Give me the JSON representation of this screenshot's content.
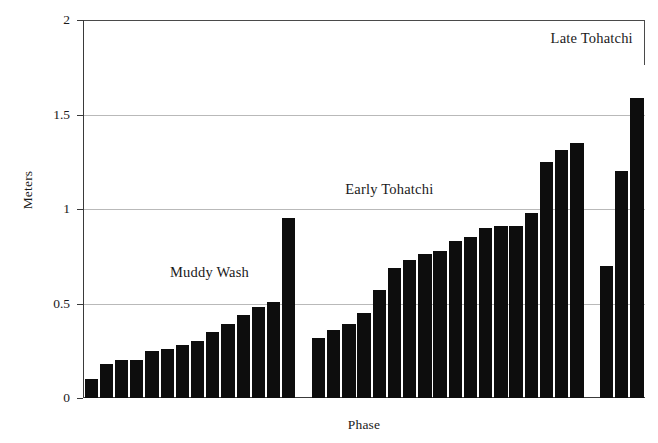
{
  "chart_data": {
    "type": "bar",
    "title": "",
    "xlabel": "Phase",
    "ylabel": "Meters",
    "ylim": [
      0,
      2
    ],
    "yticks": [
      0,
      0.5,
      1,
      1.5,
      2
    ],
    "ytick_labels": [
      "0",
      "0.5",
      "1",
      "1.5",
      "2"
    ],
    "grid": "horizontal",
    "legend": "none",
    "bar_color": "#0d0d0d",
    "annotations": [
      {
        "label": "Muddy Wash",
        "x_frac": 0.225,
        "y_value": 0.66
      },
      {
        "label": "Early Tohatchi",
        "x_frac": 0.545,
        "y_value": 1.1
      },
      {
        "label": "Late Tohatchi",
        "x_frac": 0.905,
        "y_value": 1.9
      }
    ],
    "groups": [
      {
        "name": "Muddy Wash",
        "values": [
          0.1,
          0.18,
          0.2,
          0.2,
          0.25,
          0.26,
          0.28,
          0.3,
          0.35,
          0.39,
          0.44,
          0.48,
          0.51,
          0.95
        ]
      },
      {
        "name": "Early Tohatchi",
        "values": [
          0.32,
          0.36,
          0.39,
          0.45,
          0.57,
          0.69,
          0.73,
          0.76,
          0.78,
          0.83,
          0.85,
          0.9,
          0.91,
          0.91,
          0.98,
          1.25,
          1.31,
          1.35
        ]
      },
      {
        "name": "Late Tohatchi",
        "values": [
          0.7,
          1.2,
          1.59,
          1.69,
          1.79
        ]
      }
    ],
    "values_flat": [
      0.1,
      0.18,
      0.2,
      0.2,
      0.25,
      0.26,
      0.28,
      0.3,
      0.35,
      0.39,
      0.44,
      0.48,
      0.51,
      0.95,
      0.32,
      0.36,
      0.39,
      0.45,
      0.57,
      0.69,
      0.73,
      0.76,
      0.78,
      0.83,
      0.85,
      0.9,
      0.91,
      0.91,
      0.98,
      1.25,
      1.31,
      1.35,
      0.7,
      1.2,
      1.59,
      1.69,
      1.79
    ]
  }
}
